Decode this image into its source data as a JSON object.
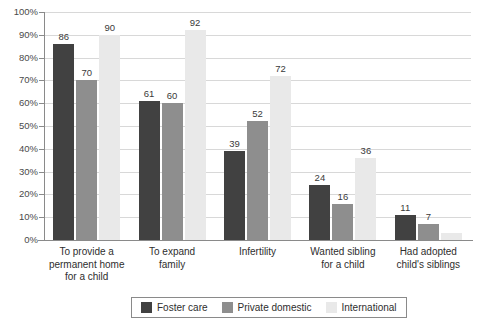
{
  "chart_data": {
    "type": "bar",
    "title": "",
    "subtitle": "",
    "xlabel": "",
    "ylabel": "",
    "ylim": [
      0,
      100
    ],
    "y_tick_labels": [
      "100%",
      "90%",
      "80%",
      "70%",
      "60%",
      "50%",
      "40%",
      "30%",
      "20%",
      "10%",
      "0%"
    ],
    "y_tick_values": [
      100,
      90,
      80,
      70,
      60,
      50,
      40,
      30,
      20,
      10,
      0
    ],
    "grid": true,
    "legend_position": "bottom-center",
    "categories": [
      "To provide a permanent home for a child",
      "To expand family",
      "Infertility",
      "Wanted sibling for a child",
      "Had adopted child's siblings"
    ],
    "category_lines": [
      [
        "To provide a",
        "permanent home",
        "for a child"
      ],
      [
        "To expand",
        "family"
      ],
      [
        "Infertility"
      ],
      [
        "Wanted sibling",
        "for a child"
      ],
      [
        "Had adopted",
        "child's siblings"
      ]
    ],
    "series": [
      {
        "name": "Foster care",
        "color": "#414141",
        "values": [
          86,
          61,
          39,
          24,
          11
        ],
        "labels": [
          "86",
          "61",
          "39",
          "24",
          "11"
        ]
      },
      {
        "name": "Private domestic",
        "color": "#8e8e8e",
        "values": [
          70,
          60,
          52,
          16,
          7
        ],
        "labels": [
          "70",
          "60",
          "52",
          "16",
          "7"
        ]
      },
      {
        "name": "International",
        "color": "#e9e9e9",
        "values": [
          90,
          92,
          72,
          36,
          3
        ],
        "labels": [
          "90",
          "92",
          "72",
          "36",
          ""
        ]
      }
    ]
  },
  "legend": {
    "items": [
      {
        "label": "Foster care",
        "color": "#414141"
      },
      {
        "label": "Private domestic",
        "color": "#8e8e8e"
      },
      {
        "label": "International",
        "color": "#e9e9e9"
      }
    ]
  }
}
